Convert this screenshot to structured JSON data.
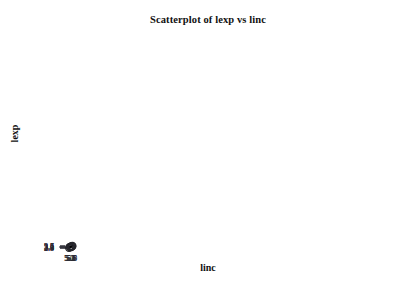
{
  "chart_data": {
    "type": "scatter",
    "title": "Scatterplot of lexp vs linc",
    "xlabel": "linc",
    "ylabel": "lexp",
    "xlim": [
      4.95,
      5.95
    ],
    "ylim": [
      2.8,
      3.7
    ],
    "grid": false,
    "legend": null,
    "x_ticks": [
      "5.0",
      "5.1",
      "5.2",
      "5.3",
      "5.4",
      "5.5",
      "5.6",
      "5.7",
      "5.8",
      "5.9"
    ],
    "y_ticks": [
      "2.8",
      "2.9",
      "3.0",
      "3.1",
      "3.2",
      "3.3",
      "3.4",
      "3.5",
      "3.6",
      "3.7"
    ],
    "x_tick_values": [
      5.0,
      5.1,
      5.2,
      5.3,
      5.4,
      5.5,
      5.6,
      5.7,
      5.8,
      5.9
    ],
    "y_tick_values": [
      2.8,
      2.9,
      3.0,
      3.1,
      3.2,
      3.3,
      3.4,
      3.5,
      3.6,
      3.7
    ],
    "marker": "open-circle",
    "marker_radius_px": 3.6,
    "point_color": "#26262c",
    "line_color": "#000000",
    "axis_color": "#3a3a42",
    "x": [
      5.01,
      5.165,
      5.3,
      5.415,
      5.52,
      5.615,
      5.705,
      5.785,
      5.86,
      5.92
    ],
    "y": [
      2.888,
      3.178,
      3.258,
      3.135,
      3.402,
      3.295,
      3.527,
      3.557,
      3.498,
      3.688
    ],
    "points": [
      {
        "x": 5.01,
        "y": 2.888
      },
      {
        "x": 5.165,
        "y": 3.178
      },
      {
        "x": 5.3,
        "y": 3.258
      },
      {
        "x": 5.415,
        "y": 3.135
      },
      {
        "x": 5.52,
        "y": 3.402
      },
      {
        "x": 5.615,
        "y": 3.295
      },
      {
        "x": 5.705,
        "y": 3.527
      },
      {
        "x": 5.785,
        "y": 3.557
      },
      {
        "x": 5.86,
        "y": 3.498
      },
      {
        "x": 5.92,
        "y": 3.688
      }
    ],
    "fit_line": {
      "name": "regression-line",
      "x_start": 5.0,
      "y_start": 2.958,
      "x_end": 5.885,
      "y_end": 3.625
    }
  }
}
